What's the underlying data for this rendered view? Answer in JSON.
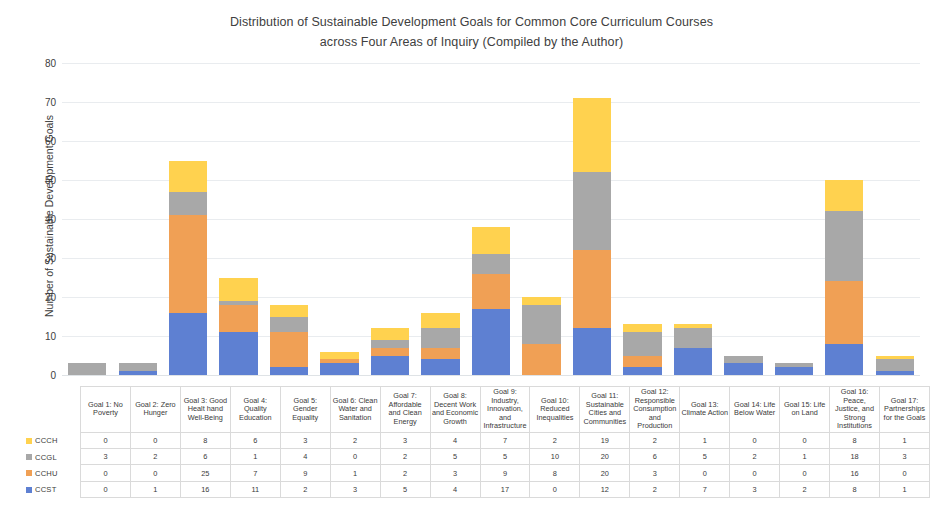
{
  "chart_data": {
    "type": "bar",
    "subtype": "stacked-column",
    "title": "Distribution of Sustainable Development Goals for Common Core Curriculum Courses across Four Areas of Inquiry (Compiled by the Author)",
    "title_lines": [
      "Distribution of Sustainable Development Goals for Common Core Curriculum Courses",
      "across Four Areas of Inquiry (Compiled by the Author)"
    ],
    "xlabel": "",
    "ylabel": "Number of Sustainable Development Goals",
    "ylim": [
      0,
      80
    ],
    "yticks": [
      0,
      10,
      20,
      30,
      40,
      50,
      60,
      70,
      80
    ],
    "grid": true,
    "legend_position": "data-table-row-labels",
    "stack_order_bottom_to_top": [
      "CCST",
      "CCHU",
      "CCGL",
      "CCCH"
    ],
    "categories": [
      "Goal 1: No Poverty",
      "Goal 2: Zero Hunger",
      "Goal 3: Good Healt hand Well-Being",
      "Goal 4: Quality Education",
      "Goal 5: Gender Equality",
      "Goal 6: Clean Water and Sanitation",
      "Goal 7: Affordable and Clean Energy",
      "Goal 8: Decent Work and Economic Growth",
      "Goal 9: Industry, Innovation, and Infrastructure",
      "Goal 10: Reduced Inequalities",
      "Goal 11: Sustainable Cities and Communities",
      "Goal 12: Responsible Consumption and Production",
      "Goal 13: Climate Action",
      "Goal 14: Life Below Water",
      "Goal 15: Life on Land",
      "Goal 16: Peace, Justice, and Strong Institutions",
      "Goal 17: Partnerships for the Goals"
    ],
    "series": [
      {
        "name": "CCCH",
        "color": "#FFD24F",
        "values": [
          0,
          0,
          8,
          6,
          3,
          2,
          3,
          4,
          7,
          2,
          19,
          2,
          1,
          0,
          0,
          8,
          1
        ]
      },
      {
        "name": "CCGL",
        "color": "#A8A8A8",
        "values": [
          3,
          2,
          6,
          1,
          4,
          0,
          2,
          5,
          5,
          10,
          20,
          6,
          5,
          2,
          1,
          18,
          3
        ]
      },
      {
        "name": "CCHU",
        "color": "#F0A055",
        "values": [
          0,
          0,
          25,
          7,
          9,
          1,
          2,
          3,
          9,
          8,
          20,
          3,
          0,
          0,
          0,
          16,
          0
        ]
      },
      {
        "name": "CCST",
        "color": "#5E80D2",
        "values": [
          0,
          1,
          16,
          11,
          2,
          3,
          5,
          4,
          17,
          0,
          12,
          2,
          7,
          3,
          2,
          8,
          1
        ]
      }
    ],
    "totals": [
      3,
      3,
      55,
      25,
      18,
      6,
      12,
      16,
      38,
      20,
      71,
      13,
      13,
      5,
      3,
      50,
      5
    ]
  },
  "table": {
    "corner_label": "",
    "column_headers": [
      "Goal 1: No Poverty",
      "Goal 2: Zero Hunger",
      "Goal 3: Good Healt hand Well-Being",
      "Goal 4: Quality Education",
      "Goal 5: Gender Equality",
      "Goal 6: Clean Water and Sanitation",
      "Goal 7: Affordable and Clean Energy",
      "Goal 8: Decent Work and Economic Growth",
      "Goal 9: Industry, Innovation, and Infrastructure",
      "Goal 10: Reduced Inequalities",
      "Goal 11: Sustainable Cities and Communities",
      "Goal 12: Responsible Consumption and Production",
      "Goal 13: Climate Action",
      "Goal 14: Life Below Water",
      "Goal 15: Life on Land",
      "Goal 16: Peace, Justice, and Strong Institutions",
      "Goal 17: Partnerships for the Goals"
    ],
    "rows": [
      {
        "label": "CCCH",
        "color": "#FFD24F",
        "values": [
          0,
          0,
          8,
          6,
          3,
          2,
          3,
          4,
          7,
          2,
          19,
          2,
          1,
          0,
          0,
          8,
          1
        ]
      },
      {
        "label": "CCGL",
        "color": "#A8A8A8",
        "values": [
          3,
          2,
          6,
          1,
          4,
          0,
          2,
          5,
          5,
          10,
          20,
          6,
          5,
          2,
          1,
          18,
          3
        ]
      },
      {
        "label": "CCHU",
        "color": "#F0A055",
        "values": [
          0,
          0,
          25,
          7,
          9,
          1,
          2,
          3,
          9,
          8,
          20,
          3,
          0,
          0,
          0,
          16,
          0
        ]
      },
      {
        "label": "CCST",
        "color": "#5E80D2",
        "values": [
          0,
          1,
          16,
          11,
          2,
          3,
          5,
          4,
          17,
          0,
          12,
          2,
          7,
          3,
          2,
          8,
          1
        ]
      }
    ]
  },
  "colors": {
    "cch": "#FFD24F",
    "ccgl": "#A8A8A8",
    "cchu": "#F0A055",
    "ccst": "#5E80D2",
    "gridline": "#e9ecef",
    "text": "#3a3a3a"
  }
}
